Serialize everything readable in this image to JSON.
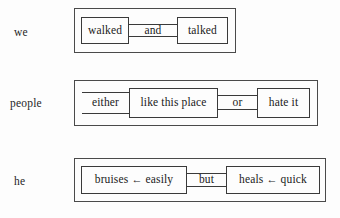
{
  "figure": {
    "type": "linguistic-coordination-diagram",
    "background_color": "#fdfdfd",
    "line_color": "#3a3a3a",
    "rows": [
      {
        "id": "row-we",
        "subject": "we",
        "outer_box": {
          "x": 74,
          "y": 8,
          "width": 162,
          "height": 45
        },
        "elements": [
          {
            "kind": "conjunct",
            "text": "walked",
            "x": 81,
            "y": 17,
            "width": 48,
            "height": 27
          },
          {
            "kind": "connective",
            "text": "and",
            "x": 129,
            "y": 24,
            "width": 48,
            "height": 13
          },
          {
            "kind": "conjunct",
            "text": "talked",
            "x": 177,
            "y": 17,
            "width": 51,
            "height": 27
          }
        ]
      },
      {
        "id": "row-people",
        "subject": "people",
        "outer_box": {
          "x": 74,
          "y": 80,
          "width": 244,
          "height": 46
        },
        "elements": [
          {
            "kind": "connective",
            "text": "either",
            "x": 82,
            "y": 92,
            "width": 47,
            "height": 22
          },
          {
            "kind": "conjunct",
            "text": "like this place",
            "x": 129,
            "y": 88,
            "width": 89,
            "height": 30
          },
          {
            "kind": "connective",
            "text": "or",
            "x": 218,
            "y": 95,
            "width": 39,
            "height": 15
          },
          {
            "kind": "conjunct",
            "text": "hate it",
            "x": 257,
            "y": 88,
            "width": 53,
            "height": 30
          }
        ]
      },
      {
        "id": "row-he",
        "subject": "he",
        "outer_box": {
          "x": 74,
          "y": 158,
          "width": 252,
          "height": 44
        },
        "elements": [
          {
            "kind": "conjunct",
            "arrow_phrase": true,
            "left": "bruises",
            "arrow": "←",
            "right": "easily",
            "text": "bruises ← easily",
            "x": 81,
            "y": 166,
            "width": 106,
            "height": 28
          },
          {
            "kind": "connective",
            "text": "but",
            "x": 187,
            "y": 173,
            "width": 39,
            "height": 14
          },
          {
            "kind": "conjunct",
            "arrow_phrase": true,
            "left": "heals",
            "arrow": "←",
            "right": "quick",
            "text": "heals ← quick",
            "x": 226,
            "y": 166,
            "width": 94,
            "height": 28
          }
        ]
      }
    ],
    "subject_labels": [
      {
        "text": "we",
        "x": 14,
        "y": 26
      },
      {
        "text": "people",
        "x": 10,
        "y": 97
      },
      {
        "text": "he",
        "x": 14,
        "y": 175
      }
    ]
  }
}
